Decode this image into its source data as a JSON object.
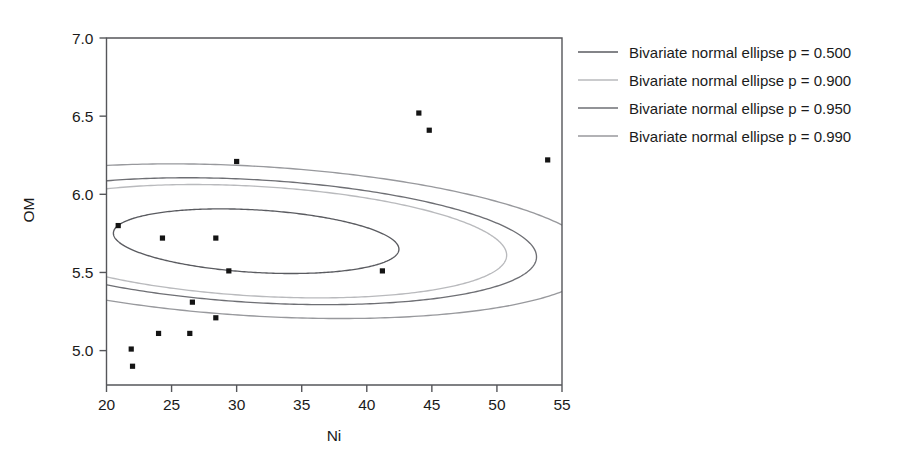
{
  "chart_data": {
    "type": "scatter",
    "title": "",
    "xlabel": "Ni",
    "ylabel": "OM",
    "xlim": [
      20,
      55
    ],
    "ylim": [
      4.78,
      7.0
    ],
    "xticks": [
      20,
      25,
      30,
      35,
      40,
      45,
      50,
      55
    ],
    "yticks": [
      5.0,
      5.5,
      6.0,
      6.5,
      7.0
    ],
    "xtick_labels": [
      "20",
      "25",
      "30",
      "35",
      "40",
      "45",
      "50",
      "55"
    ],
    "ytick_labels": [
      "5.0",
      "5.5",
      "6.0",
      "6.5",
      "7.0"
    ],
    "grid": false,
    "legend_position": "right",
    "points": [
      {
        "x": 20.9,
        "y": 5.8
      },
      {
        "x": 21.9,
        "y": 5.01
      },
      {
        "x": 22.0,
        "y": 4.9
      },
      {
        "x": 24.0,
        "y": 5.11
      },
      {
        "x": 24.3,
        "y": 5.72
      },
      {
        "x": 26.4,
        "y": 5.11
      },
      {
        "x": 26.6,
        "y": 5.31
      },
      {
        "x": 28.4,
        "y": 5.72
      },
      {
        "x": 28.4,
        "y": 5.21
      },
      {
        "x": 29.4,
        "y": 5.51
      },
      {
        "x": 30.0,
        "y": 6.21
      },
      {
        "x": 41.2,
        "y": 5.51
      },
      {
        "x": 44.0,
        "y": 6.52
      },
      {
        "x": 44.8,
        "y": 6.41
      },
      {
        "x": 53.9,
        "y": 6.22
      }
    ],
    "ellipses": [
      {
        "label": "Bivariate normal ellipse p = 0.500",
        "p": 0.5,
        "color": "#5a5b60",
        "center": [
          31.5,
          5.7
        ],
        "semi_major": 11.0,
        "semi_minor": 3.05,
        "rotation_deg": -4.4,
        "y_scale": 0.0655
      },
      {
        "label": "Bivariate normal ellipse p = 0.900",
        "p": 0.9,
        "color": "#b9babd",
        "center": [
          31.5,
          5.7
        ],
        "semi_major": 19.3,
        "semi_minor": 5.35,
        "rotation_deg": -4.4,
        "y_scale": 0.0655
      },
      {
        "label": "Bivariate normal ellipse p = 0.950",
        "p": 0.95,
        "color": "#6e6f74",
        "center": [
          31.5,
          5.7
        ],
        "semi_major": 21.6,
        "semi_minor": 5.99,
        "rotation_deg": -4.4,
        "y_scale": 0.0655
      },
      {
        "label": "Bivariate normal ellipse p = 0.990",
        "p": 0.99,
        "color": "#98999d",
        "center": [
          31.5,
          5.7
        ],
        "semi_major": 26.3,
        "semi_minor": 7.3,
        "rotation_deg": -4.4,
        "y_scale": 0.0655
      }
    ]
  },
  "axes": {
    "x_title": "Ni",
    "y_title": "OM"
  },
  "legend": {
    "entries": [
      {
        "label": "Bivariate normal ellipse p = 0.500",
        "color": "#5a5b60"
      },
      {
        "label": "Bivariate normal ellipse p = 0.900",
        "color": "#b9babd"
      },
      {
        "label": "Bivariate normal ellipse p = 0.950",
        "color": "#6e6f74"
      },
      {
        "label": "Bivariate normal ellipse p = 0.990",
        "color": "#98999d"
      }
    ]
  }
}
